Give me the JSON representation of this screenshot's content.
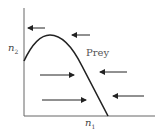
{
  "figure": {
    "type": "phase-plane",
    "x_axis_label": "n",
    "x_axis_sub": "1",
    "y_axis_label": "n",
    "y_axis_sub": "2",
    "curve_label": "Prey",
    "colors": {
      "line": "#222222",
      "text": "#444444",
      "background": "#ffffff"
    }
  },
  "chart_data": {
    "type": "line",
    "title": "",
    "xlabel": "n1",
    "ylabel": "n2",
    "series": [
      {
        "name": "Prey",
        "description": "prey zero-growth isocline (hump-shaped)",
        "points": [
          [
            24,
            61
          ],
          [
            30,
            50
          ],
          [
            38,
            40
          ],
          [
            50,
            35
          ],
          [
            62,
            38
          ],
          [
            75,
            52
          ],
          [
            90,
            82
          ],
          [
            108,
            116
          ]
        ]
      }
    ],
    "arrows": [
      {
        "x1": 45,
        "y1": 28,
        "x2": 28,
        "y2": 28,
        "direction": "left"
      },
      {
        "x1": 90,
        "y1": 35,
        "x2": 72,
        "y2": 35,
        "direction": "left"
      },
      {
        "x1": 40,
        "y1": 75,
        "x2": 74,
        "y2": 75,
        "direction": "right"
      },
      {
        "x1": 127,
        "y1": 72,
        "x2": 100,
        "y2": 72,
        "direction": "left"
      },
      {
        "x1": 42,
        "y1": 100,
        "x2": 86,
        "y2": 100,
        "direction": "right"
      },
      {
        "x1": 144,
        "y1": 96,
        "x2": 113,
        "y2": 96,
        "direction": "left"
      }
    ],
    "grid": false
  }
}
